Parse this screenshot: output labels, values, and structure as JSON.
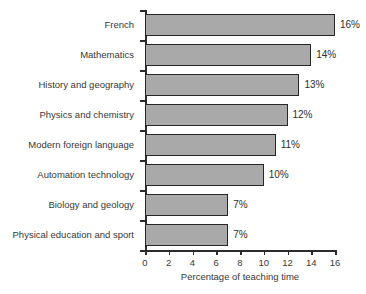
{
  "chart_data": {
    "type": "bar",
    "orientation": "horizontal",
    "title": "",
    "xlabel": "Percentage of teaching time",
    "ylabel": "",
    "xlim": [
      0,
      16
    ],
    "xticks": [
      0,
      2,
      4,
      6,
      8,
      10,
      12,
      14,
      16
    ],
    "grid": false,
    "legend": null,
    "categories": [
      "French",
      "Mathematics",
      "History and geography",
      "Physics and chemistry",
      "Modern foreign language",
      "Automation technology",
      "Biology and geology",
      "Physical education and sport"
    ],
    "values": [
      16,
      14,
      13,
      12,
      11,
      10,
      7,
      7
    ],
    "value_labels": [
      "16%",
      "14%",
      "13%",
      "12%",
      "11%",
      "10%",
      "7%",
      "7%"
    ],
    "colors": {
      "bar_fill": "#a9a9a9",
      "bar_border": "#262626",
      "axis": "#2b2b2b",
      "text": "#383838",
      "background": "#ffffff"
    }
  }
}
